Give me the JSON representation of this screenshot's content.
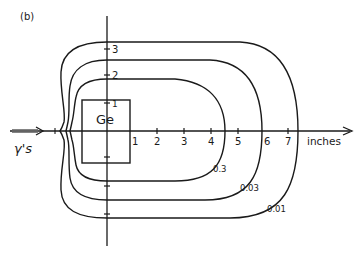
{
  "panel_label": "(b)",
  "detector": {
    "label": "Ge"
  },
  "beam": {
    "label": "γ's",
    "icon": "arrow-right-icon"
  },
  "x_axis": {
    "unit_label": "inches",
    "ticks": [
      {
        "value": 1,
        "label": "1"
      },
      {
        "value": 2,
        "label": "2"
      },
      {
        "value": 3,
        "label": "3"
      },
      {
        "value": 4,
        "label": "4"
      },
      {
        "value": 5,
        "label": "5"
      },
      {
        "value": 6,
        "label": "6"
      },
      {
        "value": 7,
        "label": "7"
      }
    ]
  },
  "y_axis": {
    "ticks": [
      {
        "value": 1,
        "label": "1"
      },
      {
        "value": 2,
        "label": "2"
      },
      {
        "value": 3,
        "label": "3"
      }
    ]
  },
  "contours": [
    {
      "label": "0.3",
      "level": 0.3
    },
    {
      "label": "0.03",
      "level": 0.03
    },
    {
      "label": "0.01",
      "level": 0.01
    }
  ],
  "colors": {
    "ink": "#1a1a1a",
    "background": "#ffffff"
  }
}
